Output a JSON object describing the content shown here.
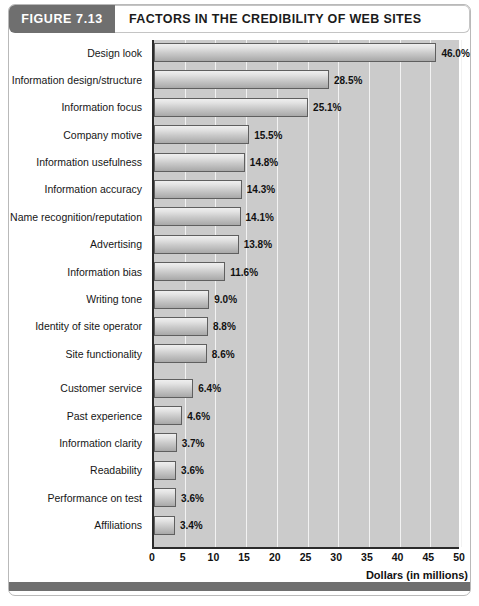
{
  "figure": {
    "tag": "FIGURE 7.13",
    "title": "FACTORS IN THE CREDIBILITY OF WEB SITES"
  },
  "colors": {
    "header_tag_bg": "#6f6f6f",
    "plot_bg": "#cbcbcb",
    "gridline": "#f2f2f2",
    "axis": "#2b2b2b",
    "bar_border": "#5f5f5f",
    "text": "#111111"
  },
  "chart_data": {
    "type": "bar",
    "orientation": "horizontal",
    "title": "FACTORS IN THE CREDIBILITY OF WEB SITES",
    "xlabel": "Dollars (in millions)",
    "ylabel": "",
    "xlim": [
      0,
      50
    ],
    "xticks": [
      0,
      5,
      10,
      15,
      20,
      25,
      30,
      35,
      40,
      45,
      50
    ],
    "grid": "vertical",
    "legend": null,
    "value_suffix": "%",
    "categories": [
      "Design look",
      "Information design/structure",
      "Information focus",
      "Company motive",
      "Information usefulness",
      "Information accuracy",
      "Name recognition/reputation",
      "Advertising",
      "Information bias",
      "Writing tone",
      "Identity of site operator",
      "Site functionality",
      "Customer service",
      "Past experience",
      "Information clarity",
      "Readability",
      "Performance on test",
      "Affiliations"
    ],
    "values": [
      46.0,
      28.5,
      25.1,
      15.5,
      14.8,
      14.3,
      14.1,
      13.8,
      11.6,
      9.0,
      8.8,
      8.6,
      6.4,
      4.6,
      3.7,
      3.6,
      3.6,
      3.4
    ],
    "value_labels": [
      "46.0%",
      "28.5%",
      "25.1%",
      "15.5%",
      "14.8%",
      "14.3%",
      "14.1%",
      "13.8%",
      "11.6%",
      "9.0%",
      "8.8%",
      "8.6%",
      "6.4%",
      "4.6%",
      "3.7%",
      "3.6%",
      "3.6%",
      "3.4%"
    ],
    "group_break_after_index": 11
  }
}
